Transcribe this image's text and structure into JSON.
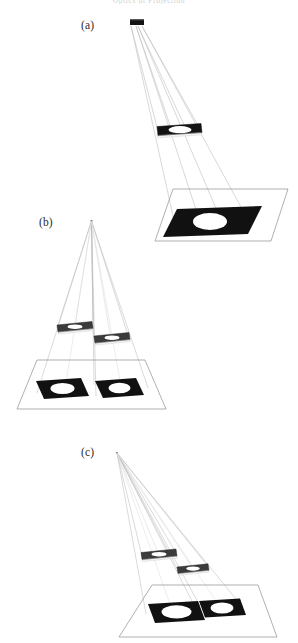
{
  "figure": {
    "kind": "optical-projection-diagram",
    "background_color": "#ffffff",
    "running_head_clipped": "Optics of Projection",
    "ink_color": "#111111",
    "ray_color": "#b4b4b4",
    "outline_color": "#8a8a8a",
    "aperture_color": "#ffffff",
    "panels": [
      {
        "id": "a",
        "label": "(a)",
        "label_x": 80,
        "label_y": 19,
        "description": "Single extended source projecting one slide onto a tilted screen",
        "source": {
          "x": 130,
          "y": 19,
          "w": 14,
          "h": 6
        },
        "slides": 1,
        "screen_images": 1
      },
      {
        "id": "b",
        "label": "(b)",
        "label_x": 38,
        "label_y": 216,
        "description": "Point source with two slides producing two separated images on the screen",
        "source": {
          "x": 91,
          "y": 220,
          "w": 2,
          "h": 2
        },
        "slides": 2,
        "screen_images": 2
      },
      {
        "id": "c",
        "label": "(c)",
        "label_x": 80,
        "label_y": 446,
        "description": "Point source with two slides producing two abutting images on the screen",
        "source": {
          "x": 117,
          "y": 452,
          "w": 2,
          "h": 2
        },
        "slides": 2,
        "screen_images": 2
      }
    ]
  }
}
